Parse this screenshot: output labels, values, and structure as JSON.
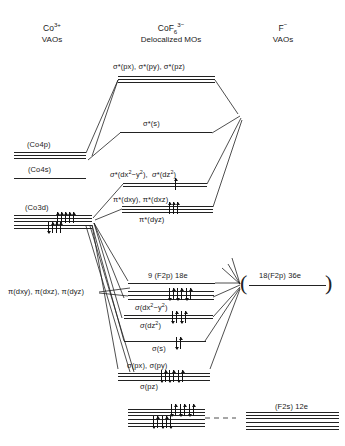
{
  "diagram": {
    "title_columns": [
      {
        "id": "left",
        "line1": "Co3+",
        "line1_base": "Co",
        "line1_sup": "3+",
        "line2": "VAOs"
      },
      {
        "id": "center",
        "line1_base": "CoF",
        "line1_sub": "6",
        "line1_sup": "3−",
        "line2": "Delocalized MOs"
      },
      {
        "id": "right",
        "line1_base": "F",
        "line1_sup": "−",
        "line2": "VAOs"
      }
    ],
    "left_levels": [
      {
        "name": "co4p",
        "label": "(Co4p)",
        "lines": 3,
        "electrons": 0
      },
      {
        "name": "co4s",
        "label": "(Co4s)",
        "lines": 1,
        "electrons": 0
      },
      {
        "name": "co3d",
        "label": "(Co3d)",
        "lines": 5,
        "electrons": 6
      }
    ],
    "center_levels": [
      {
        "name": "sigma-star-p",
        "label": "σ*(px), σ*(py),  σ*(pz)",
        "lines": 3,
        "electrons": 0
      },
      {
        "name": "sigma-star-s",
        "label": "σ*(s)",
        "lines": 1,
        "electrons": 0
      },
      {
        "name": "sigma-star-d",
        "label": "σ*(dx2−y2),  σ*(dz2)",
        "lines": 2,
        "electrons": 1
      },
      {
        "name": "pi-star-d",
        "label": "π*(dxy),  π*(dxz)",
        "label2": "π*(dyz)",
        "lines": 3,
        "electrons": 3
      },
      {
        "name": "f2p-nonbonding",
        "label": "9 (F2p) 18e",
        "lines": 1,
        "electrons": 0
      },
      {
        "name": "pi-bonding",
        "label": "",
        "lines": 3,
        "electrons": 6
      },
      {
        "name": "sigma-d",
        "label": "σ(dx2−y2)",
        "label2": "σ(dz2)",
        "lines": 2,
        "electrons": 4
      },
      {
        "name": "sigma-s",
        "label": "σ(s)",
        "lines": 1,
        "electrons": 2
      },
      {
        "name": "sigma-p",
        "label": "σ(px),  σ(py)",
        "label2": "σ(pz)",
        "lines": 3,
        "electrons": 6
      },
      {
        "name": "f2s-center",
        "label": "",
        "lines": 6,
        "electrons": 12
      }
    ],
    "right_levels": [
      {
        "name": "f2p-right",
        "label": "18(F2p) 36e",
        "lines": 1,
        "electrons": 0,
        "bracketed": true
      },
      {
        "name": "f2s-right",
        "label": "(F2s) 12e",
        "lines": 6,
        "electrons": 0
      }
    ],
    "annotations": [
      {
        "name": "pi-d-left-label",
        "text": "π(dxy), π(dxz), π(dyz)"
      }
    ],
    "colors": {
      "line": "#222222",
      "text": "#1a1a1a",
      "background": "#ffffff"
    }
  }
}
